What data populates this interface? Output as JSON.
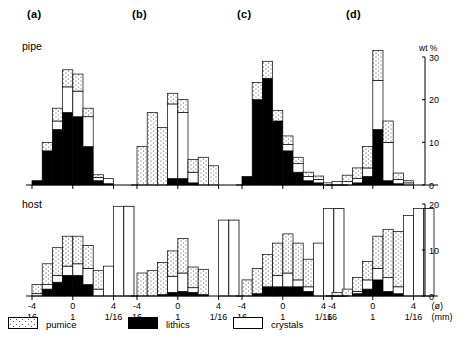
{
  "figure": {
    "panels": [
      {
        "label": "(a)"
      },
      {
        "label": "(b)"
      },
      {
        "label": "(c)"
      },
      {
        "label": "(d)"
      }
    ],
    "row_labels": {
      "top": "pipe",
      "bottom": "host"
    },
    "axis": {
      "x_phi_ticks": [
        "-4",
        "0",
        "4"
      ],
      "x_mm_ticks": [
        "16",
        "1",
        "1/16"
      ],
      "x_unit_phi": "(ø)",
      "x_unit_mm": "(mm)",
      "y_title": "wt %",
      "y_top_ticks": [
        "0",
        "10",
        "20",
        "30"
      ],
      "y_bottom_ticks": [
        "0",
        "10",
        "20"
      ]
    },
    "legend": [
      {
        "key": "pumice",
        "label": "pumice",
        "fill": "#ffffff",
        "pattern": "stipple"
      },
      {
        "key": "lithics",
        "label": "lithics",
        "fill": "#000000",
        "pattern": "solid"
      },
      {
        "key": "crystals",
        "label": "crystals",
        "fill": "#ffffff",
        "pattern": "plain"
      }
    ]
  },
  "chart_data": {
    "type": "bar",
    "xlabel": "(ø) / (mm)",
    "ylabel": "wt %",
    "grid": false,
    "legend_position": "bottom",
    "components": [
      "pumice",
      "lithics",
      "crystals"
    ],
    "stacking": "stacked",
    "x_phi": [
      -5,
      -4,
      -3,
      -2,
      -1,
      0,
      1,
      2,
      3,
      4,
      5
    ],
    "x_mm_equiv": [
      "32",
      "16",
      "8",
      "4",
      "2",
      "1",
      "1/2",
      "1/4",
      "1/8",
      "1/16",
      "1/32"
    ],
    "panels": [
      {
        "id": "a",
        "name": "(a)",
        "rows": [
          {
            "row": "pipe",
            "ylim": [
              0,
              30
            ],
            "bins_phi": [
              -4,
              -3,
              -2,
              -1,
              0,
              1,
              2,
              3,
              4
            ],
            "pumice": [
              0.0,
              2.0,
              3.0,
              4.0,
              4.0,
              2.0,
              0.6,
              0.0,
              0.0
            ],
            "lithics": [
              1.0,
              8.0,
              13.0,
              17.0,
              16.0,
              9.0,
              1.0,
              0.3,
              0.0
            ],
            "crystals": [
              0.0,
              0.0,
              2.0,
              6.0,
              6.0,
              7.0,
              0.8,
              1.2,
              0.0
            ]
          },
          {
            "row": "host",
            "ylim": [
              0,
              20
            ],
            "bins_phi": [
              -4,
              -3,
              -2,
              -1,
              0,
              1,
              2,
              3,
              4
            ],
            "pumice": [
              2.0,
              4.5,
              6.0,
              6.5,
              6.0,
              5.0,
              4.0,
              0.0,
              0.0
            ],
            "lithics": [
              0.0,
              1.5,
              3.0,
              4.5,
              4.5,
              2.5,
              0.0,
              0.0,
              0.0
            ],
            "crystals": [
              0.5,
              1.0,
              1.5,
              2.0,
              2.5,
              3.5,
              1.5,
              6.5,
              19.5
            ]
          }
        ]
      },
      {
        "id": "b",
        "name": "(b)",
        "rows": [
          {
            "row": "pipe",
            "ylim": [
              0,
              30
            ],
            "bins_phi": [
              -4,
              -3,
              -2,
              -1,
              0,
              1,
              2,
              3,
              4
            ],
            "pumice": [
              9.0,
              17.0,
              13.5,
              2.5,
              3.0,
              3.0,
              6.5,
              4.5,
              0.0
            ],
            "lithics": [
              0.0,
              0.0,
              0.0,
              1.5,
              1.5,
              0.5,
              0.0,
              0.0,
              0.0
            ],
            "crystals": [
              0.0,
              0.0,
              0.0,
              17.5,
              15.5,
              2.5,
              0.0,
              0.0,
              0.0
            ]
          },
          {
            "row": "host",
            "ylim": [
              0,
              20
            ],
            "bins_phi": [
              -4,
              -3,
              -2,
              -1,
              0,
              1,
              2,
              3,
              4
            ],
            "pumice": [
              5.0,
              5.5,
              7.0,
              5.5,
              7.5,
              4.5,
              5.5,
              0.0,
              0.0
            ],
            "lithics": [
              0.0,
              0.0,
              0.3,
              0.8,
              1.0,
              0.8,
              0.3,
              0.0,
              0.0
            ],
            "crystals": [
              0.0,
              0.0,
              0.0,
              3.5,
              4.0,
              1.0,
              0.0,
              0.0,
              16.5
            ]
          }
        ]
      },
      {
        "id": "c",
        "name": "(c)",
        "rows": [
          {
            "row": "pipe",
            "ylim": [
              0,
              30
            ],
            "bins_phi": [
              -4,
              -3,
              -2,
              -1,
              0,
              1,
              2,
              3,
              4
            ],
            "pumice": [
              0.0,
              4.0,
              4.0,
              2.5,
              2.0,
              1.5,
              1.0,
              0.8,
              0.0
            ],
            "lithics": [
              2.0,
              20.0,
              25.0,
              15.0,
              8.0,
              3.0,
              1.0,
              0.5,
              0.0
            ],
            "crystals": [
              0.0,
              0.0,
              0.0,
              0.0,
              1.5,
              2.0,
              1.0,
              0.8,
              0.5
            ]
          },
          {
            "row": "host",
            "ylim": [
              0,
              20
            ],
            "bins_phi": [
              -4,
              -3,
              -2,
              -1,
              0,
              1,
              2,
              3,
              4
            ],
            "pumice": [
              3.5,
              5.5,
              7.0,
              7.0,
              8.5,
              8.0,
              6.0,
              0.0,
              0.0
            ],
            "lithics": [
              0.0,
              0.5,
              2.0,
              2.0,
              2.0,
              2.0,
              1.0,
              0.0,
              0.0
            ],
            "crystals": [
              0.0,
              0.0,
              0.0,
              2.5,
              3.0,
              1.5,
              1.0,
              11.5,
              19.0
            ]
          }
        ]
      },
      {
        "id": "d",
        "name": "(d)",
        "rows": [
          {
            "row": "pipe",
            "ylim": [
              0,
              30
            ],
            "bins_phi": [
              -4,
              -3,
              -2,
              -1,
              0,
              1,
              2,
              3,
              4
            ],
            "pumice": [
              0.0,
              1.5,
              2.5,
              5.0,
              7.0,
              5.0,
              1.5,
              0.5,
              0.0
            ],
            "lithics": [
              0.0,
              0.0,
              0.5,
              2.0,
              13.0,
              1.0,
              0.3,
              0.0,
              0.0
            ],
            "crystals": [
              0.8,
              0.8,
              1.0,
              2.0,
              11.5,
              9.0,
              1.0,
              0.5,
              0.0
            ]
          },
          {
            "row": "host",
            "ylim": [
              0,
              20
            ],
            "bins_phi": [
              -4,
              -3,
              -2,
              -1,
              0,
              1,
              2,
              3,
              4
            ],
            "pumice": [
              0.8,
              1.5,
              3.0,
              4.0,
              7.0,
              10.5,
              12.0,
              0.0,
              0.0
            ],
            "lithics": [
              0.0,
              0.0,
              0.5,
              1.5,
              3.5,
              1.0,
              0.5,
              0.0,
              0.0
            ],
            "crystals": [
              0.0,
              0.0,
              0.5,
              2.0,
              2.5,
              3.0,
              1.5,
              17.5,
              19.0
            ]
          }
        ]
      }
    ]
  }
}
